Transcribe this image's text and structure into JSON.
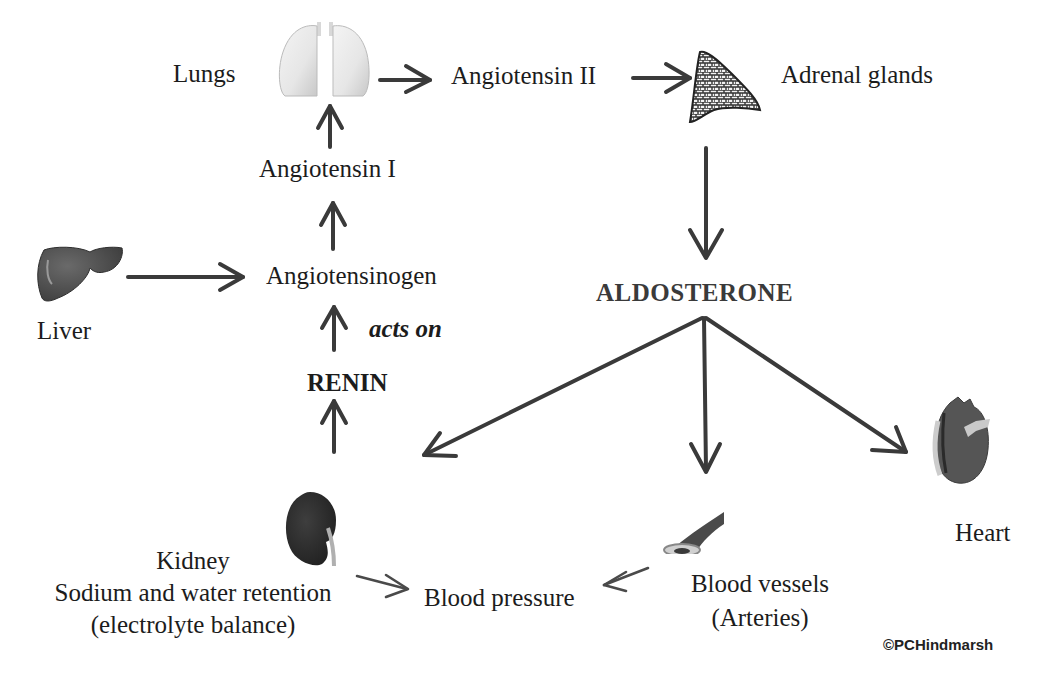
{
  "diagram": {
    "colors": {
      "arrow": "#3a3a3a",
      "text": "#1c1c1c",
      "background": "#ffffff"
    },
    "nodes": {
      "lungs": {
        "label": "Lungs",
        "icon": "lungs-icon"
      },
      "angiotensin_ii": {
        "label": "Angiotensin II"
      },
      "adrenal": {
        "label": "Adrenal glands",
        "icon": "adrenal-gland-icon"
      },
      "angiotensin_i": {
        "label": "Angiotensin I"
      },
      "liver": {
        "label": "Liver",
        "icon": "liver-icon"
      },
      "angiotensinogen": {
        "label": "Angiotensinogen"
      },
      "acts_on": {
        "label": "acts on"
      },
      "renin": {
        "label": "RENIN"
      },
      "aldosterone": {
        "label": "ALDOSTERONE"
      },
      "kidney": {
        "label": "Kidney",
        "line2": "Sodium and water retention",
        "line3": "(electrolyte balance)",
        "icon": "kidney-icon"
      },
      "blood_pressure": {
        "label": "Blood pressure"
      },
      "blood_vessels": {
        "label": "Blood vessels",
        "line2": "(Arteries)",
        "icon": "artery-icon"
      },
      "heart": {
        "label": "Heart",
        "icon": "heart-icon"
      }
    },
    "edges": [
      {
        "from": "Lungs",
        "to": "Angiotensin II"
      },
      {
        "from": "Angiotensin II",
        "to": "Adrenal glands"
      },
      {
        "from": "Adrenal glands",
        "to": "ALDOSTERONE"
      },
      {
        "from": "Angiotensin I",
        "to": "Lungs"
      },
      {
        "from": "Angiotensinogen",
        "to": "Angiotensin I"
      },
      {
        "from": "Liver",
        "to": "Angiotensinogen"
      },
      {
        "from": "RENIN",
        "to": "Angiotensinogen",
        "label": "acts on"
      },
      {
        "from": "Kidney",
        "to": "RENIN"
      },
      {
        "from": "ALDOSTERONE",
        "to": "Kidney"
      },
      {
        "from": "ALDOSTERONE",
        "to": "Blood vessels"
      },
      {
        "from": "ALDOSTERONE",
        "to": "Heart"
      },
      {
        "from": "Kidney",
        "to": "Blood pressure"
      },
      {
        "from": "Blood vessels",
        "to": "Blood pressure"
      }
    ],
    "copyright": "©PCHindmarsh"
  }
}
